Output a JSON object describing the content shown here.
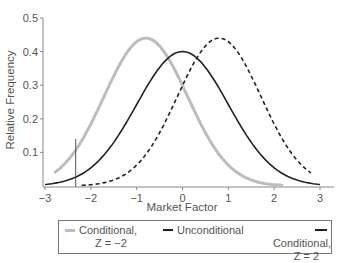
{
  "chart_data": {
    "type": "line",
    "title": "",
    "xlabel": "Market Factor",
    "ylabel": "Relative Frequency",
    "xlim": [
      -3,
      3
    ],
    "ylim": [
      0,
      0.5
    ],
    "x_ticks": [
      "-3",
      "-2",
      "-1",
      "0",
      "1",
      "2",
      "3"
    ],
    "y_ticks": [
      "0.1",
      "0.2",
      "0.3",
      "0.4",
      "0.5"
    ],
    "grid": false,
    "legend_position": "bottom",
    "series": [
      {
        "name": "Conditional, Z = -2",
        "style": "solid",
        "color": "#bdbdbd",
        "mean": -0.8,
        "sd": 0.91,
        "peak": 0.44,
        "x": [
          -2.8,
          -2.0,
          -1.5,
          -1.0,
          -0.8,
          -0.5,
          0.0,
          0.5,
          1.0,
          1.5,
          2.0,
          2.2
        ],
        "y": [
          0.03,
          0.18,
          0.33,
          0.43,
          0.44,
          0.42,
          0.3,
          0.16,
          0.06,
          0.02,
          0.005,
          0.003
        ]
      },
      {
        "name": "Unconditional",
        "style": "solid",
        "color": "#222222",
        "mean": 0,
        "sd": 1,
        "peak": 0.4,
        "x": [
          -3,
          -2,
          -1,
          0,
          1,
          2,
          3
        ],
        "y": [
          0.004,
          0.054,
          0.242,
          0.399,
          0.242,
          0.054,
          0.004
        ]
      },
      {
        "name": "Conditional, Z = 2",
        "style": "dashed",
        "color": "#222222",
        "mean": 0.8,
        "sd": 0.91,
        "peak": 0.44,
        "x": [
          -2.2,
          -1.5,
          -1.0,
          -0.5,
          0.0,
          0.5,
          0.8,
          1.0,
          1.5,
          2.0,
          2.8
        ],
        "y": [
          0.003,
          0.02,
          0.06,
          0.16,
          0.3,
          0.42,
          0.44,
          0.43,
          0.33,
          0.18,
          0.03
        ]
      }
    ],
    "annotations": [
      {
        "type": "vertical-line",
        "x": -2.33,
        "y_top": 0.14
      }
    ]
  },
  "legend": {
    "items": [
      {
        "line1": "Conditional,",
        "line2": "Z = −2"
      },
      {
        "line1": "Unconditional",
        "line2": ""
      },
      {
        "line1": "Conditional,",
        "line2": "Z = 2"
      }
    ]
  }
}
